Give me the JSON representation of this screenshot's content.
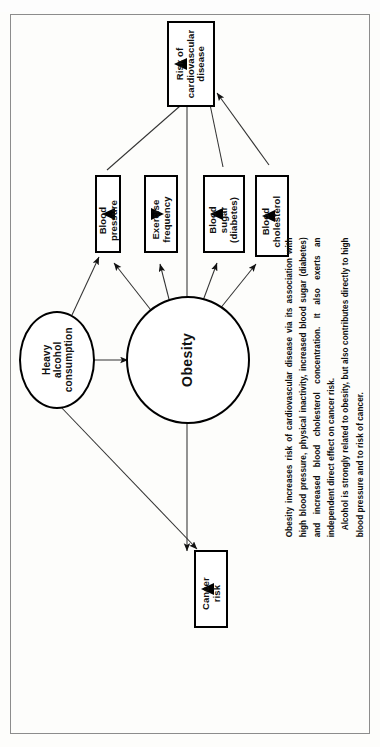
{
  "page": {
    "clipped_heading": "...AND ALCOHOL ON HEALTH RISK",
    "background_color": "#fdfdfb",
    "frame_border_color": "#8c8c8c"
  },
  "diagram": {
    "type": "causal-influence-diagram",
    "orientation": "rotated-90-ccw",
    "nodes": [
      {
        "id": "risk-cvd",
        "shape": "box",
        "label": "Risk of\ncardiovascular\ndisease",
        "label_lines": [
          "Risk of",
          "cardiovascular",
          "disease"
        ],
        "inner_arrow": "up"
      },
      {
        "id": "blood-pressure",
        "shape": "box",
        "label": "Blood pressure",
        "label_lines": [
          "Blood pressure"
        ],
        "inner_arrow": "up"
      },
      {
        "id": "exercise-frequency",
        "shape": "box",
        "label": "Exercise\nfrequency",
        "label_lines": [
          "Exercise",
          "frequency"
        ],
        "inner_arrow": "down"
      },
      {
        "id": "blood-sugar",
        "shape": "box",
        "label": "Blood\nsugar\n(diabetes)",
        "label_lines": [
          "Blood",
          "sugar",
          "(diabetes)"
        ],
        "inner_arrow": "up"
      },
      {
        "id": "blood-cholesterol",
        "shape": "box",
        "label": "Blood\ncholesterol",
        "label_lines": [
          "Blood",
          "cholesterol"
        ],
        "inner_arrow": "up"
      },
      {
        "id": "cancer-risk",
        "shape": "box",
        "label": "Cancer\nrisk",
        "label_lines": [
          "Cancer",
          "risk"
        ],
        "inner_arrow": "up"
      },
      {
        "id": "heavy-alcohol",
        "shape": "ellipse",
        "label": "Heavy\nalcohol\nconsumption",
        "label_lines": [
          "Heavy",
          "alcohol",
          "consumption"
        ],
        "inner_arrow": "none"
      },
      {
        "id": "obesity",
        "shape": "ellipse",
        "label": "Obesity",
        "label_lines": [
          "Obesity"
        ],
        "inner_arrow": "none"
      }
    ],
    "edges": [
      {
        "from": "obesity",
        "to": "blood-pressure"
      },
      {
        "from": "obesity",
        "to": "exercise-frequency"
      },
      {
        "from": "obesity",
        "to": "blood-sugar"
      },
      {
        "from": "obesity",
        "to": "blood-cholesterol"
      },
      {
        "from": "obesity",
        "to": "risk-cvd"
      },
      {
        "from": "obesity",
        "to": "cancer-risk"
      },
      {
        "from": "heavy-alcohol",
        "to": "obesity"
      },
      {
        "from": "heavy-alcohol",
        "to": "blood-pressure"
      },
      {
        "from": "heavy-alcohol",
        "to": "cancer-risk"
      },
      {
        "from": "blood-pressure",
        "to": "risk-cvd"
      },
      {
        "from": "blood-sugar",
        "to": "risk-cvd"
      },
      {
        "from": "blood-cholesterol",
        "to": "risk-cvd"
      }
    ]
  },
  "caption": {
    "paragraph_1": "Obesity increases risk of cardiovascular disease via its association with high blood pressure, physical inactivity, increased blood sugar (diabetes) and increased blood cholesterol concentration. It also exerts an independent direct effect on cancer risk.",
    "paragraph_2": "Alcohol is strongly related to obesity, but also contributes directly to high blood pressure and to risk of cancer."
  }
}
